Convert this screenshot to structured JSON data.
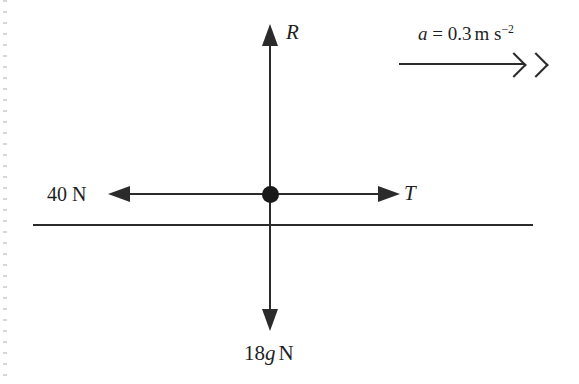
{
  "diagram": {
    "ink_color": "#2b2b2b",
    "background_color": "#ffffff",
    "margin_dot_color": "#c9c9c9",
    "labels": {
      "normal_reaction": "R",
      "tension": "T",
      "applied_force": "40 N",
      "weight_number": "18",
      "weight_gravity": "g",
      "weight_unit": "N",
      "accel_symbol": "a",
      "accel_equals": "=",
      "accel_value": "0.3",
      "accel_unit_base": "m s",
      "accel_unit_exponent": "−2"
    },
    "icons": {
      "arrow_up": "arrow-up-icon",
      "arrow_down": "arrow-down-icon",
      "arrow_left": "arrow-left-icon",
      "arrow_right": "arrow-right-icon",
      "double_chevron": "double-chevron-right-icon",
      "junction": "junction-dot-icon",
      "ground": "ground-line-icon"
    }
  }
}
